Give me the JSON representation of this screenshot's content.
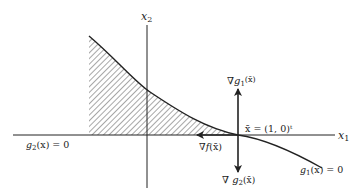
{
  "diagram": {
    "type": "constraint-geometry",
    "colors": {
      "ink": "#222222",
      "background": "#ffffff"
    },
    "axes": {
      "x1_label": "x",
      "x1_sub": "1",
      "x2_label": "x",
      "x2_sub": "2"
    },
    "point": {
      "label": "x̄ = (1, 0)ᵗ"
    },
    "vectors": {
      "grad_g1": {
        "nabla": "∇",
        "fn": "g",
        "sub": "1",
        "arg": "(x̄)"
      },
      "grad_g2": {
        "nabla": "∇ ",
        "fn": "g",
        "sub": "2",
        "arg": "(x̄)"
      },
      "grad_f": {
        "nabla": "∇",
        "fn": "f",
        "arg": "(x̄)"
      }
    },
    "constraints": {
      "g1": {
        "fn": "g",
        "sub": "1",
        "rest": "(x) = 0"
      },
      "g2": {
        "fn": "g",
        "sub": "2",
        "rest": "(x) = 0"
      }
    },
    "feasible_region": {
      "fill": "hatched",
      "description": "region under curve g1 above x1-axis"
    }
  }
}
